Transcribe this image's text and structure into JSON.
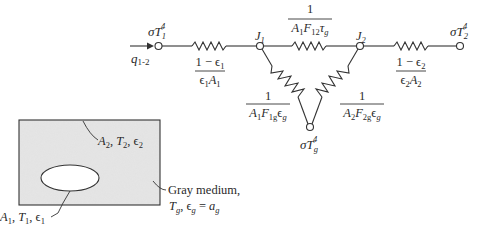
{
  "diagram": {
    "heat_flow": {
      "label_base": "q",
      "label_sub": "1-2"
    },
    "nodes": {
      "surface1": {
        "label": "σT",
        "sub": "1",
        "sup": "4"
      },
      "J1": {
        "label": "J",
        "sub": "1"
      },
      "J2": {
        "label": "J",
        "sub": "2"
      },
      "surface2": {
        "label": "σT",
        "sub": "2",
        "sup": "4"
      },
      "gas": {
        "label": "σT",
        "sub": "g",
        "sup": "4"
      }
    },
    "resistors": {
      "surface1": {
        "numerator": "1 − ϵ",
        "num_sub": "1",
        "denominator": "ϵ",
        "den_sub1": "1",
        "den_mid": "A",
        "den_sub2": "1"
      },
      "J1_J2": {
        "numerator": "1",
        "den_a": "A",
        "den_a_sub": "1",
        "den_f": "F",
        "den_f_sub": "12",
        "den_t": "τ",
        "den_t_sub": "g"
      },
      "J1_gas": {
        "numerator": "1",
        "den_a": "A",
        "den_a_sub": "1",
        "den_f": "F",
        "den_f_sub": "1g",
        "den_e": "ϵ",
        "den_e_sub": "g"
      },
      "J2_gas": {
        "numerator": "1",
        "den_a": "A",
        "den_a_sub": "2",
        "den_f": "F",
        "den_f_sub": "2g",
        "den_e": "ϵ",
        "den_e_sub": "g"
      },
      "surface2": {
        "numerator": "1 − ϵ",
        "num_sub": "2",
        "denominator": "ϵ",
        "den_sub1": "2",
        "den_mid": "A",
        "den_sub2": "2"
      }
    },
    "enclosure": {
      "outer_label": {
        "a": "A",
        "a_sub": "2",
        "t": "T",
        "t_sub": "2",
        "e": "ϵ",
        "e_sub": "2"
      },
      "inner_label": {
        "a": "A",
        "a_sub": "1",
        "t": "T",
        "t_sub": "1",
        "e": "ϵ",
        "e_sub": "1"
      },
      "medium_label_line1": "Gray medium,",
      "medium_label_line2": {
        "t": "T",
        "t_sub": "g",
        "e": "ϵ",
        "e_sub": "g",
        "eq": " = ",
        "a": "a",
        "a_sub": "g"
      }
    },
    "colors": {
      "line": "#333333",
      "medium_fill": "#e4e4e4",
      "text": "#2a2a2a"
    }
  }
}
